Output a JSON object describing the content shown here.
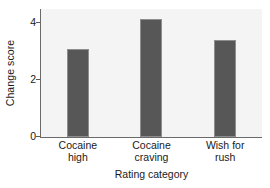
{
  "chart_data": {
    "type": "bar",
    "title": "",
    "xlabel": "Rating category",
    "ylabel": "Change score",
    "categories": [
      "Cocaine\nhigh",
      "Cocaine\ncraving",
      "Wish for\nrush"
    ],
    "values": [
      3.1,
      4.15,
      3.4
    ],
    "yticks": [
      0,
      2,
      4
    ],
    "ytick_labels": [
      "0",
      "2",
      "4"
    ],
    "ylim": [
      0,
      4.5
    ],
    "grid": false,
    "legend": null,
    "bar_color": "#575757",
    "bar_edge_color": "#8e8e8e",
    "plot_background": "#f4f4f4",
    "axis_color": "#6a6a6a"
  }
}
